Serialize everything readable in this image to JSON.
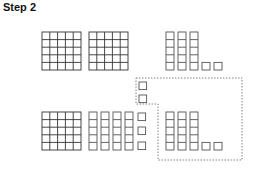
{
  "title": "Step 2",
  "colors": {
    "grid_stroke": "#333333",
    "tower_stroke": "#555555",
    "dotted_stroke": "#666666",
    "background": "#ffffff"
  },
  "top_row": {
    "hundreds_grids": 2,
    "tens_columns": 3,
    "ones_units": 2
  },
  "regrouping_box": {
    "units_moved": 2
  },
  "bottom_row": {
    "hundreds_grids": 1,
    "tens_columns": 4,
    "extra_units_column": 3,
    "boxed_tens_columns": 3,
    "boxed_ones_units": 2
  }
}
